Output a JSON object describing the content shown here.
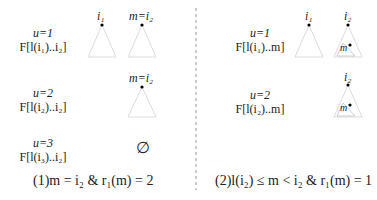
{
  "left_panel": {
    "rows": [
      {
        "u": "u=1",
        "range": "F[l(i₁)..i₂]",
        "nodes": [
          "i₁",
          "m=i₂"
        ]
      },
      {
        "u": "u=2",
        "range": "F[l(i₂)..i₂]",
        "nodes": [
          "m=i₂"
        ]
      },
      {
        "u": "u=3",
        "range": "F[l(i₃)..i₂]",
        "empty": "∅"
      }
    ],
    "caption": "(1)m = i₂ & r₁(m) = 2"
  },
  "right_panel": {
    "rows": [
      {
        "u": "u=1",
        "range": "F[l(i₁)..m]",
        "nodes": [
          "i₁",
          "i₂"
        ],
        "inner": "m"
      },
      {
        "u": "u=2",
        "range": "F[l(i₂)..m]",
        "nodes": [
          "i₂"
        ],
        "inner": "m"
      }
    ],
    "caption": "(2)l(i₂) ≤ m < i₂ & r₁(m) = 1"
  }
}
